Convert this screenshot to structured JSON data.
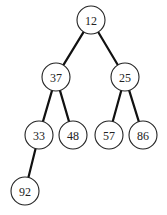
{
  "diagram": {
    "type": "binary-tree",
    "node_radius": 14,
    "nodes": [
      {
        "id": "n0",
        "label": "12",
        "x": 91,
        "y": 20
      },
      {
        "id": "n1",
        "label": "37",
        "x": 56,
        "y": 77
      },
      {
        "id": "n2",
        "label": "25",
        "x": 125,
        "y": 77
      },
      {
        "id": "n3",
        "label": "33",
        "x": 39,
        "y": 135
      },
      {
        "id": "n4",
        "label": "48",
        "x": 73,
        "y": 135
      },
      {
        "id": "n5",
        "label": "57",
        "x": 109,
        "y": 135
      },
      {
        "id": "n6",
        "label": "86",
        "x": 143,
        "y": 135
      },
      {
        "id": "n7",
        "label": "92",
        "x": 25,
        "y": 191
      }
    ],
    "edges": [
      {
        "from": "n0",
        "to": "n1"
      },
      {
        "from": "n0",
        "to": "n2"
      },
      {
        "from": "n1",
        "to": "n3"
      },
      {
        "from": "n1",
        "to": "n4"
      },
      {
        "from": "n2",
        "to": "n5"
      },
      {
        "from": "n2",
        "to": "n6"
      },
      {
        "from": "n3",
        "to": "n7"
      }
    ],
    "colors": {
      "background": "#ffffff",
      "edge": "#111111",
      "node_stroke": "#222222",
      "node_fill": "#ffffff",
      "text": "#222222"
    }
  }
}
